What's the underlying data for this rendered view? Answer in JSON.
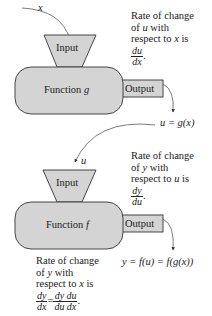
{
  "stage_g": {
    "input_var": "x",
    "input_label": "Input",
    "function_label": "Function",
    "function_name": "g",
    "output_label": "Output",
    "result": "u = g(x)",
    "rate_note": {
      "line1": "Rate of change",
      "line2_pre": "of ",
      "line2_var": "u",
      "line2_post": " with",
      "line3_pre": "respect to ",
      "line3_var": "x",
      "line3_post": " is",
      "frac_num": "du",
      "frac_den": "dx",
      "end": "."
    }
  },
  "stage_f": {
    "input_var": "u",
    "input_label": "Input",
    "function_label": "Function",
    "function_name": "f",
    "output_label": "Output",
    "result": "y = f(u) = f(g(x))",
    "rate_note": {
      "line1": "Rate of change",
      "line2_pre": "of ",
      "line2_var": "y",
      "line2_post": " with",
      "line3_pre": "respect to ",
      "line3_var": "u",
      "line3_post": " is",
      "frac_num": "dy",
      "frac_den": "du",
      "end": "."
    }
  },
  "chain_rule_note": {
    "line1": "Rate of change",
    "line2_pre": "of ",
    "line2_var": "y",
    "line2_post": " with",
    "line3_pre": "respect to ",
    "line3_var": "x",
    "line3_post": " is",
    "lhs_num": "dy",
    "lhs_den": "dx",
    "equals": "=",
    "r1_num": "dy",
    "r1_den": "du",
    "r2_num": "du",
    "r2_den": "dx",
    "end": "."
  },
  "colors": {
    "shape_fill": "#d4d4d4",
    "stroke": "#333333",
    "background": "#ffffff"
  }
}
